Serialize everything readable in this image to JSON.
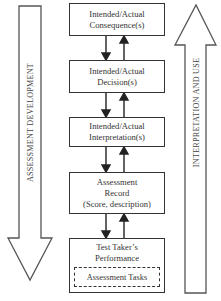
{
  "diagram": {
    "left_arrow": {
      "label": "ASSESSMENT DEVELOPMENT",
      "direction": "down"
    },
    "right_arrow": {
      "label": "INTERPRETATION AND USE",
      "direction": "up"
    },
    "boxes": [
      {
        "lines": [
          "Intended/Actual",
          "Consequence(s)"
        ]
      },
      {
        "lines": [
          "Intended/Actual",
          "Decision(s)"
        ]
      },
      {
        "lines": [
          "Intended/Actual",
          "Interpretation(s)"
        ]
      },
      {
        "lines": [
          "Assessment",
          "Record",
          "(Score, description)"
        ]
      },
      {
        "lines": [
          "Test Taker’s",
          "Performance"
        ],
        "inner": "Assessment Tasks"
      }
    ],
    "connectors": "Each adjacent pair of boxes is linked by a downward arrow (left) and an upward arrow (right)"
  }
}
